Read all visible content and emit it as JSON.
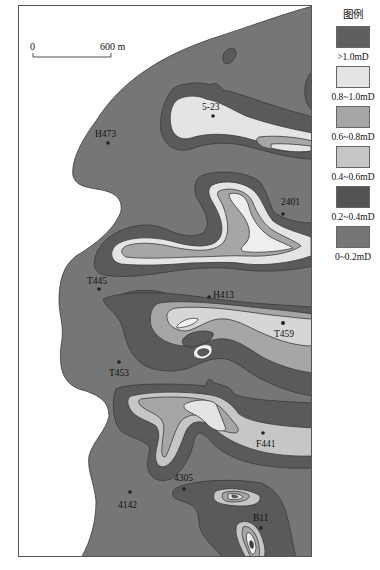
{
  "legend": {
    "title": "图例",
    "items": [
      {
        "label": ">1.0mD",
        "color": "#5f5f5f"
      },
      {
        "label": "0.8~1.0mD",
        "color": "#e4e4e4"
      },
      {
        "label": "0.6~0.8mD",
        "color": "#a6a6a6"
      },
      {
        "label": "0.4~0.6mD",
        "color": "#c6c6c6"
      },
      {
        "label": "0.2~0.4mD",
        "color": "#545454"
      },
      {
        "label": "0~0.2mD",
        "color": "#767676"
      }
    ]
  },
  "scale_bar": {
    "start_label": "0",
    "end_label": "600 m"
  },
  "wells": [
    {
      "name": "5-23",
      "x": 194,
      "y": 110
    },
    {
      "name": "H473",
      "x": 89,
      "y": 138
    },
    {
      "name": "2401",
      "x": 262,
      "y": 207
    },
    {
      "name": "T445",
      "x": 80,
      "y": 282
    },
    {
      "name": "H413",
      "x": 190,
      "y": 291
    },
    {
      "name": "T459",
      "x": 264,
      "y": 317
    },
    {
      "name": "T453",
      "x": 101,
      "y": 356
    },
    {
      "name": "F441",
      "x": 244,
      "y": 426
    },
    {
      "name": "4305",
      "x": 164,
      "y": 483
    },
    {
      "name": "4142",
      "x": 111,
      "y": 486
    },
    {
      "name": "B11",
      "x": 241,
      "y": 526
    }
  ],
  "colors": {
    "zone_0_0.2": "#767676",
    "zone_0.2_0.4": "#5a5a5a",
    "zone_0.4_0.6": "#c6c6c6",
    "zone_0.6_0.8": "#a6a6a6",
    "zone_0.8_1.0": "#e4e4e4",
    "zone_gt_1.0": "#5f5f5f",
    "outline": "#3a3a3a"
  }
}
